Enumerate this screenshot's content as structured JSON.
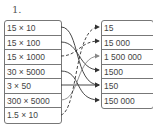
{
  "exercise_number": "1.",
  "left_items": [
    "15 × 10",
    "15 × 100",
    "15 × 1000",
    "30 × 5000",
    "3 × 50",
    "300 × 5000",
    "1.5 × 10"
  ],
  "right_items": [
    "15",
    "15 000",
    "1 500 000",
    "1500",
    "150",
    "150 000"
  ],
  "connections": [
    {
      "from": 0,
      "to": 4,
      "style": "solid"
    },
    {
      "from": 1,
      "to": 3,
      "style": "solid"
    },
    {
      "from": 2,
      "to": 1,
      "style": "dashed"
    },
    {
      "from": 3,
      "to": 5,
      "style": "solid"
    },
    {
      "from": 4,
      "to": 4,
      "style": "solid"
    },
    {
      "from": 5,
      "to": 2,
      "style": "solid-gray"
    },
    {
      "from": 6,
      "to": 0,
      "style": "dashed"
    }
  ]
}
